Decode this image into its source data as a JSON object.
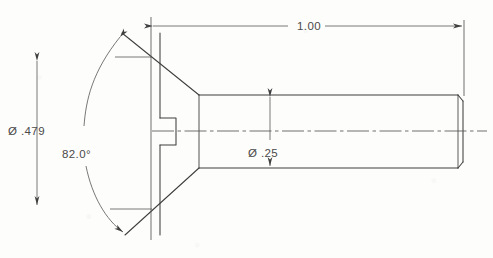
{
  "drawing": {
    "title": "Flat Countersunk Head Slotted Screw - Section View",
    "background_color": "#fdfdfb",
    "line_color": "#3f3f3f",
    "text_color": "#4a4a4a",
    "dimensions": [
      {
        "id": "head-diameter",
        "label": "Ø .479",
        "value": 0.479,
        "symbol": "diameter",
        "orientation": "vertical",
        "text_x": 8,
        "text_y": 135
      },
      {
        "id": "countersink-angle",
        "label": "82.0°",
        "value": 82.0,
        "symbol": "angle",
        "orientation": "arc",
        "text_x": 62,
        "text_y": 158
      },
      {
        "id": "shaft-diameter",
        "label": "Ø .25",
        "value": 0.25,
        "symbol": "diameter",
        "orientation": "vertical",
        "text_x": 248,
        "text_y": 157
      },
      {
        "id": "overall-length",
        "label": "1.00",
        "value": 1.0,
        "symbol": "linear",
        "orientation": "horizontal",
        "text_x": 297,
        "text_y": 29
      }
    ],
    "geometry": {
      "centerline_y": 131,
      "head_apex_top": {
        "x": 122,
        "y": 33
      },
      "head_apex_bottom": {
        "x": 125,
        "y": 235
      },
      "head_face_x": 160,
      "shaft_start_x": 199,
      "shaft_end_x": 463,
      "shaft_top_y": 95,
      "shaft_bottom_y": 168,
      "slot_depth_x": 176
    }
  }
}
